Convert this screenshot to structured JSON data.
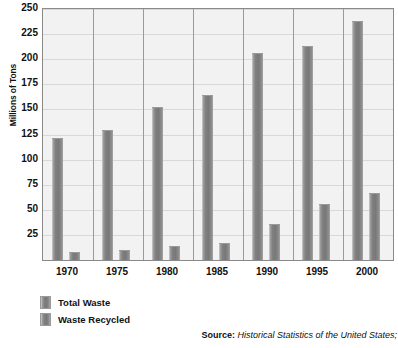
{
  "chart_data": {
    "type": "bar",
    "title": "",
    "subtitle": "",
    "xlabel": "",
    "ylabel": "Millions of Tons",
    "categories": [
      "1970",
      "1975",
      "1980",
      "1985",
      "1990",
      "1995",
      "2000"
    ],
    "series": [
      {
        "name": "Total Waste",
        "values": [
          122,
          129,
          152,
          164,
          206,
          213,
          238
        ]
      },
      {
        "name": "Waste Recycled",
        "values": [
          8,
          10,
          14,
          17,
          36,
          56,
          67
        ]
      }
    ],
    "ylim": [
      0,
      250
    ],
    "y_ticks": [
      250,
      225,
      200,
      175,
      150,
      125,
      100,
      75,
      50,
      25
    ],
    "y_tick_labels": [
      "250",
      "225",
      "200",
      "175",
      "150",
      "125",
      "100",
      "75",
      "50",
      "25"
    ],
    "grid": true,
    "legend_position": "bottom-left",
    "annotations": {
      "source_label": "Source:",
      "source_text": "Historical Statistics of the United States;"
    }
  },
  "colors": {
    "bar_light": "#d2d2d2",
    "bar_mid": "#9d9d9d",
    "bar_dark": "#787878",
    "plot_background": "#f2f2f2",
    "gridline": "#d8d8d8",
    "panel_divider": "#9a9a9a",
    "axis_border": "#8a8a8a",
    "text": "#111111"
  }
}
